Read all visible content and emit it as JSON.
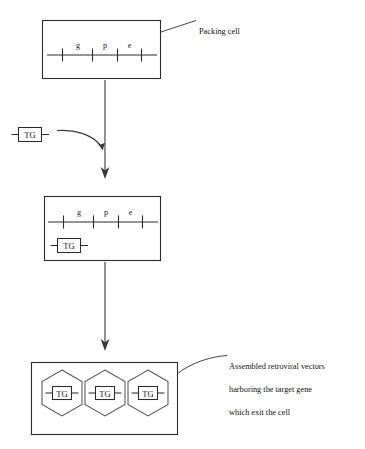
{
  "diagram": {
    "annotations": {
      "packing_cell": "Packing cell",
      "vectors_line1": "Assembled retroviral vectors",
      "vectors_line2": "harboring the target gene",
      "vectors_line3": "which exit the cell"
    },
    "genome": {
      "gene_labels": [
        "g",
        "p",
        "e"
      ],
      "tick_count": 4
    },
    "transgene": {
      "label": "TG"
    },
    "stages": [
      {
        "name": "packing-cell-initial",
        "label": "Packing cell",
        "contains_genome": true,
        "contains_transgene": false,
        "vector_count": 0
      },
      {
        "name": "packing-cell-with-transgene",
        "label": "",
        "contains_genome": true,
        "contains_transgene": true,
        "vector_count": 0
      },
      {
        "name": "assembled-vectors-cell",
        "label": "Assembled retroviral vectors harboring the target gene which exit the cell",
        "contains_genome": false,
        "contains_transgene": false,
        "vector_count": 3
      }
    ],
    "free_transgene": {
      "label": "TG",
      "description": "free target gene construct entering the cell"
    },
    "vectors": [
      {
        "label": "TG"
      },
      {
        "label": "TG"
      },
      {
        "label": "TG"
      }
    ],
    "colors": {
      "stroke": "#2b2b2b",
      "arrow": "#3a3a3a",
      "hexagon_stroke": "#555555",
      "background": "#ffffff",
      "text": "#111111"
    }
  }
}
